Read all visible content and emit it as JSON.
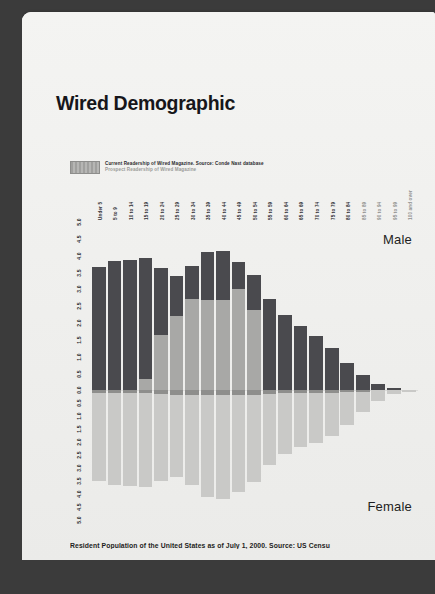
{
  "page": {
    "title": "Wired Demographic",
    "footer": "Resident Population of the United States as of July 1, 2000. Source: US Censu"
  },
  "legend": {
    "swatch_name": "legend-swatch",
    "line1": "Current Readership of Wired Magazine. Source: Conde Nast database",
    "line2": "Prospect Readership of Wired Magazine"
  },
  "labels": {
    "male": "Male",
    "female": "Female"
  },
  "colors": {
    "page": "#f2f2f0",
    "backdrop": "#3b3b3b",
    "male_bar": "#4a4a4e",
    "female_bar": "#c9c9c7",
    "readership_overlay": "#a8a8a6",
    "title_text": "#16161a"
  },
  "chart_data": {
    "type": "bar",
    "title": "Wired Demographic",
    "subtitle": "Resident Population of the United States as of July 1, 2000. Source: US Censu",
    "orientation": "population-pyramid-vertical",
    "xlabel": "",
    "ylabel": "",
    "grid": false,
    "legend_position": "top-left",
    "ylim": [
      -5.0,
      5.0
    ],
    "yticks_up": [
      "5.0",
      "4.5",
      "4.0",
      "3.5",
      "3.0",
      "2.5",
      "2.0",
      "1.5",
      "1.0",
      "0.5",
      "0.0"
    ],
    "yticks_down": [
      "0.5",
      "1.0",
      "1.5",
      "2.0",
      "2.5",
      "3.0",
      "3.5",
      "4.0",
      "4.5",
      "5.0"
    ],
    "categories": [
      "Under 5",
      "5 to 9",
      "10 to 14",
      "15 to 19",
      "20 to 24",
      "25 to 29",
      "30 to 34",
      "35 to 39",
      "40 to 44",
      "45 to 49",
      "50 to 54",
      "55 to 59",
      "60 to 64",
      "65 to 69",
      "70 to 74",
      "75 to 79",
      "80 to 84",
      "85 to 89",
      "90 to 94",
      "95 to 99",
      "100 and over"
    ],
    "series": [
      {
        "name": "Male",
        "direction": "up",
        "values": [
          3.65,
          3.85,
          3.88,
          3.93,
          3.63,
          3.4,
          3.68,
          4.1,
          4.13,
          3.82,
          3.42,
          2.72,
          2.25,
          1.9,
          1.62,
          1.25,
          0.82,
          0.45,
          0.2,
          0.06,
          0.02
        ]
      },
      {
        "name": "Female",
        "direction": "down",
        "values": [
          3.48,
          3.66,
          3.68,
          3.72,
          3.48,
          3.33,
          3.66,
          4.12,
          4.18,
          3.91,
          3.55,
          2.88,
          2.45,
          2.18,
          2.02,
          1.75,
          1.35,
          0.85,
          0.42,
          0.14,
          0.05
        ]
      },
      {
        "name": "Wired readership (current)",
        "direction": "up-overlay",
        "values": [
          0.0,
          0.0,
          0.0,
          0.35,
          1.65,
          2.2,
          2.72,
          2.68,
          2.68,
          3.0,
          2.4,
          0.0,
          0.0,
          0.0,
          0.0,
          0.0,
          0.0,
          0.0,
          0.0,
          0.0,
          0.0
        ]
      },
      {
        "name": "Wired readership (prospect)",
        "direction": "down-overlay",
        "values": [
          0.1,
          0.1,
          0.1,
          0.1,
          0.14,
          0.18,
          0.18,
          0.18,
          0.18,
          0.18,
          0.18,
          0.14,
          0.12,
          0.1,
          0.1,
          0.1,
          0.08,
          0.06,
          0.0,
          0.0,
          0.0
        ]
      }
    ]
  }
}
